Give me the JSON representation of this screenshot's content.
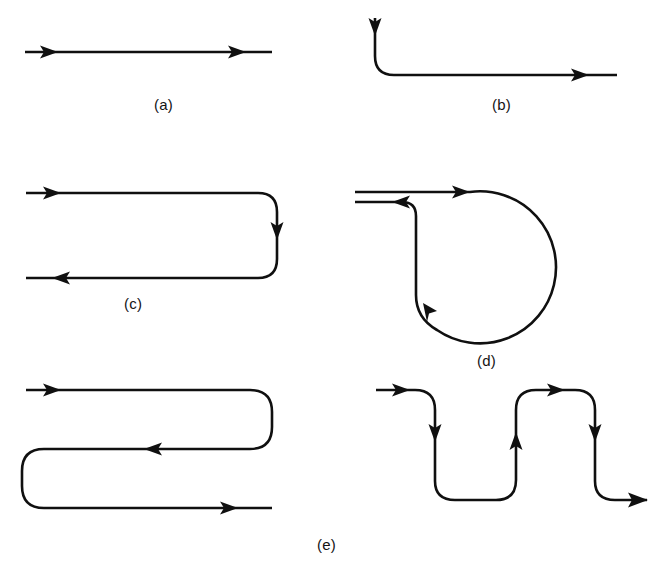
{
  "figure": {
    "kind": "line-diagram",
    "background_color": "#ffffff",
    "ink_color": "#101010",
    "stroke_width": 2.6,
    "panels": [
      {
        "id": "a",
        "caption": "(a)",
        "name": "straight-path",
        "summary": "Horizontal straight line with two rightward arrowheads",
        "arrow_count": 2,
        "arrow_directions": [
          "right",
          "right"
        ]
      },
      {
        "id": "b",
        "caption": "(b)",
        "name": "ninety-degree-bend-path",
        "summary": "Vertical segment entering downward, 90 degree rounded bend, long horizontal run to the right",
        "arrow_count": 2,
        "arrow_directions": [
          "down",
          "right"
        ]
      },
      {
        "id": "c",
        "caption": "(c)",
        "name": "u-turn-path",
        "summary": "Hairpin 180 degree turn: top run right, rounded right side descending, bottom run back left",
        "arrow_count": 3,
        "arrow_directions": [
          "right",
          "down",
          "left"
        ]
      },
      {
        "id": "d",
        "caption": "(d)",
        "name": "loop-path",
        "summary": "Circular loop: line enters right, sweeps clockwise around a full circle, returns and exits left just beneath the entry line",
        "arrow_count": 3,
        "arrow_directions": [
          "right",
          "up-left",
          "left"
        ]
      },
      {
        "id": "e",
        "caption": "(e)",
        "name": "serpentine-and-square-wave-paths",
        "summary": "Left: serpentine with two hairpin turns. Right: square-wave zigzag with four rounded right angle bends",
        "arrow_count": 9,
        "arrow_directions": [
          "right",
          "left",
          "right",
          "right",
          "down",
          "up",
          "right",
          "down",
          "right"
        ]
      }
    ],
    "captions": {
      "a": "(a)",
      "b": "(b)",
      "c": "(c)",
      "d": "(d)",
      "e": "(e)"
    }
  }
}
